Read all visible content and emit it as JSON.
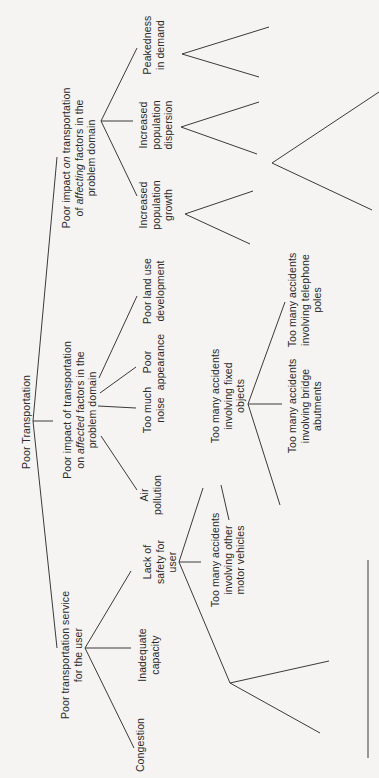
{
  "diagram": {
    "title": "Poor Transportation",
    "root": {
      "label": [
        "Poor Transportation"
      ],
      "pos": [
        26,
        422
      ]
    },
    "nodes": [
      {
        "id": "affecting",
        "label": [
          "Poor impact on transportation",
          "of affecting factors in the",
          "problem domain"
        ],
        "pos": [
          79,
          158
        ]
      },
      {
        "id": "affected",
        "label": [
          "Poor impact of transportation",
          "on affected factors in the",
          "problem domain"
        ],
        "pos": [
          80,
          410
        ]
      },
      {
        "id": "service",
        "label": [
          "Poor transportation service",
          "for the user"
        ],
        "pos": [
          71,
          655
        ]
      },
      {
        "id": "peakedness",
        "label": [
          "Peakedness",
          "in demand"
        ],
        "pos": [
          153,
          45
        ]
      },
      {
        "id": "dispersion",
        "label": [
          "Increased",
          "population",
          "dispersion"
        ],
        "pos": [
          156,
          125
        ]
      },
      {
        "id": "growth",
        "label": [
          "Increased",
          "population",
          "growth"
        ],
        "pos": [
          156,
          205
        ]
      },
      {
        "id": "land-use",
        "label": [
          "Poor land use",
          "development"
        ],
        "pos": [
          153,
          291
        ]
      },
      {
        "id": "appearance",
        "label": [
          "Poor",
          "appearance"
        ],
        "pos": [
          153,
          362
        ]
      },
      {
        "id": "noise",
        "label": [
          "Too much",
          "noise"
        ],
        "pos": [
          153,
          410
        ]
      },
      {
        "id": "air",
        "label": [
          "Air",
          "pollution"
        ],
        "pos": [
          150,
          495
        ]
      },
      {
        "id": "safety",
        "label": [
          "Lack of",
          "safety for",
          "user"
        ],
        "pos": [
          160,
          562
        ]
      },
      {
        "id": "capacity",
        "label": [
          "Inadequate",
          "capacity"
        ],
        "pos": [
          148,
          655
        ]
      },
      {
        "id": "congestion",
        "label": [
          "Congestion"
        ],
        "pos": [
          140,
          745
        ]
      },
      {
        "id": "fixed-objects",
        "label": [
          "Too many accidents",
          "involving fixed",
          "objects"
        ],
        "pos": [
          228,
          396
        ]
      },
      {
        "id": "motor-vehicles",
        "label": [
          "Too many accidents",
          "involving other",
          "motor vehicles"
        ],
        "pos": [
          228,
          560
        ]
      },
      {
        "id": "telephone-poles",
        "label": [
          "Too many accidents",
          "involving telephone",
          "poles"
        ],
        "pos": [
          305,
          300
        ]
      },
      {
        "id": "bridge-abutments",
        "label": [
          "Too many accidents",
          "involving bridge",
          "abutments"
        ],
        "pos": [
          305,
          406
        ]
      }
    ],
    "italic_words": {
      "affecting": "affecting",
      "affected": "affected",
      "on_word": "on"
    },
    "edges": [
      {
        "name": "root-spine-upper",
        "points": [
          [
            57,
            157
          ],
          [
            33,
            421
          ]
        ]
      },
      {
        "name": "root-spine-lower",
        "points": [
          [
            33,
            421
          ],
          [
            57,
            648
          ]
        ]
      },
      {
        "name": "root-to-affected",
        "points": [
          [
            33,
            421
          ],
          [
            53,
            421
          ]
        ]
      },
      {
        "name": "affecting-to-peakedness",
        "points": [
          [
            101,
            121
          ],
          [
            137,
            48
          ]
        ]
      },
      {
        "name": "affecting-to-dispersion",
        "points": [
          [
            101,
            121
          ],
          [
            133,
            121
          ]
        ]
      },
      {
        "name": "affecting-to-growth",
        "points": [
          [
            101,
            121
          ],
          [
            137,
            196
          ]
        ]
      },
      {
        "name": "affected-to-land-use",
        "points": [
          [
            99,
            378
          ],
          [
            137,
            296
          ]
        ]
      },
      {
        "name": "affected-to-appearance",
        "points": [
          [
            100,
            393
          ],
          [
            136,
            367
          ]
        ]
      },
      {
        "name": "affected-to-noise",
        "points": [
          [
            98,
            406
          ],
          [
            136,
            408
          ]
        ]
      },
      {
        "name": "affected-to-air",
        "points": [
          [
            101,
            436
          ],
          [
            137,
            490
          ]
        ]
      },
      {
        "name": "service-to-safety",
        "points": [
          [
            85,
            648
          ],
          [
            131,
            571
          ]
        ]
      },
      {
        "name": "service-to-capacity",
        "points": [
          [
            85,
            648
          ],
          [
            131,
            648
          ]
        ]
      },
      {
        "name": "service-to-congestion",
        "points": [
          [
            85,
            648
          ],
          [
            134,
            748
          ]
        ]
      },
      {
        "name": "safety-to-fixed-objects",
        "points": [
          [
            179,
            562
          ],
          [
            203,
            488
          ]
        ]
      },
      {
        "name": "safety-to-motor-vehicles",
        "points": [
          [
            179,
            562
          ],
          [
            201,
            562
          ]
        ]
      },
      {
        "name": "safety-to-unlabeled",
        "points": [
          [
            179,
            562
          ],
          [
            230,
            683
          ]
        ]
      },
      {
        "name": "fixed-to-telephone",
        "points": [
          [
            248,
            404
          ],
          [
            285,
            302
          ]
        ]
      },
      {
        "name": "fixed-to-bridge",
        "points": [
          [
            248,
            404
          ],
          [
            282,
            404
          ]
        ]
      },
      {
        "name": "fixed-to-unlabeled",
        "points": [
          [
            248,
            404
          ],
          [
            280,
            505
          ]
        ]
      },
      {
        "name": "peakedness-chevron",
        "points": [
          [
            269,
            27
          ],
          [
            182,
            54
          ],
          [
            259,
            77
          ]
        ]
      },
      {
        "name": "dispersion-chevron",
        "points": [
          [
            259,
            102
          ],
          [
            181,
            127
          ],
          [
            257,
            154
          ]
        ]
      },
      {
        "name": "growth-chevron",
        "points": [
          [
            253,
            191
          ],
          [
            185,
            214
          ],
          [
            250,
            244
          ]
        ]
      },
      {
        "name": "big-chevron",
        "points": [
          [
            379,
            92
          ],
          [
            272,
            163
          ],
          [
            372,
            210
          ]
        ]
      },
      {
        "name": "safety-sub-chevron",
        "points": [
          [
            329,
            661
          ],
          [
            230,
            683
          ],
          [
            320,
            733
          ]
        ]
      },
      {
        "name": "fixed-sub-line",
        "points": [
          [
            221,
            485
          ],
          [
            229,
            520
          ]
        ]
      },
      {
        "name": "right-vertical-rule",
        "points": [
          [
            368,
            560
          ],
          [
            368,
            758
          ]
        ]
      }
    ]
  }
}
